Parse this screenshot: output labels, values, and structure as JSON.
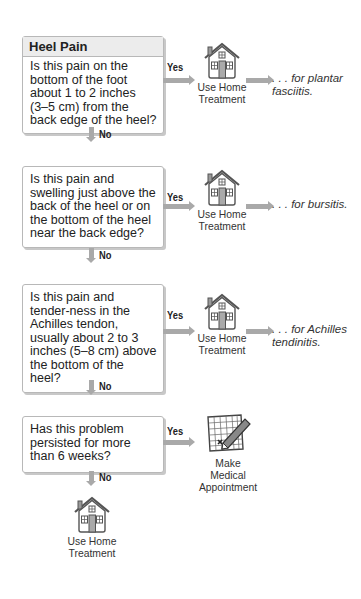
{
  "title": "Heel Pain",
  "questions": [
    {
      "text": "Is this pain on the bottom of the foot about 1 to 2 inches (3–5 cm) from the back edge of the heel?",
      "yes_label": "Yes",
      "no_label": "No",
      "yes_action": "Use Home Treatment",
      "yes_result": ". . . for plantar fasciitis."
    },
    {
      "text": "Is this pain and swelling just above the back of the heel or on the bottom of the heel near the back edge?",
      "yes_label": "Yes",
      "no_label": "No",
      "yes_action": "Use Home Treatment",
      "yes_result": ". . . for bursitis."
    },
    {
      "text": "Is this pain and tender-ness in the Achilles tendon, usually about 2 to 3 inches (5–8 cm) above the bottom of the heel?",
      "yes_label": "Yes",
      "no_label": "No",
      "yes_action": "Use Home Treatment",
      "yes_result": ". . . for Achilles tendinitis."
    },
    {
      "text": "Has this problem persisted for more than 6 weeks?",
      "yes_label": "Yes",
      "no_label": "No",
      "yes_action": "Make Medical Appointment",
      "yes_result": ""
    }
  ],
  "final": {
    "action": "Use Home Treatment"
  },
  "colors": {
    "arrow": "#a9a9a9",
    "box_border": "#b8b8b8",
    "header_bg": "#ececec"
  }
}
